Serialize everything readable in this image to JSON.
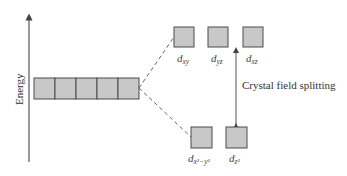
{
  "diagram": {
    "type": "crystal-field-splitting",
    "axis": {
      "label": "Energy",
      "direction": "up"
    },
    "degenerate_set": {
      "count": 5,
      "label": ""
    },
    "upper_set": {
      "orbitals": [
        {
          "base": "d",
          "sub": "xy"
        },
        {
          "base": "d",
          "sub": "yz"
        },
        {
          "base": "d",
          "sub": "xz"
        }
      ]
    },
    "lower_set": {
      "orbitals": [
        {
          "base": "d",
          "sub": "x²−y²"
        },
        {
          "base": "d",
          "sub": "z²"
        }
      ]
    },
    "splitting_label": "Crystal field splitting",
    "colors": {
      "box_fill": "#c8c8c8",
      "box_stroke": "#4a4a4a",
      "lines": "#555555"
    }
  }
}
